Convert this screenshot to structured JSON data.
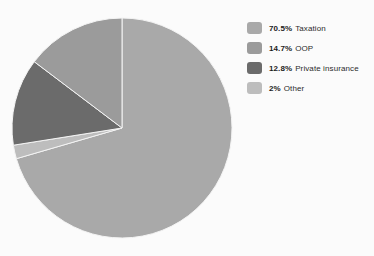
{
  "chart_data": {
    "type": "pie",
    "title": "",
    "subtitle": "",
    "xlabel": "",
    "ylabel": "",
    "grid": false,
    "legend_position": "right",
    "units": "percent",
    "total": 100,
    "start_angle_deg": 0,
    "direction": "clockwise",
    "categories": [
      "Taxation",
      "OOP",
      "Private insurance",
      "Other"
    ],
    "values": [
      70.5,
      14.7,
      12.8,
      2
    ],
    "value_labels": [
      "70.5%",
      "14.7%",
      "12.8%",
      "2%"
    ],
    "colors": [
      "#a9a9a9",
      "#9b9b9b",
      "#6b6b6b",
      "#bdbdbd"
    ],
    "slices": [
      {
        "label": "Taxation",
        "value": 70.5,
        "value_label": "70.5%",
        "color": "#a9a9a9"
      },
      {
        "label": "OOP",
        "value": 14.7,
        "value_label": "14.7%",
        "color": "#9b9b9b"
      },
      {
        "label": "Private insurance",
        "value": 12.8,
        "value_label": "12.8%",
        "color": "#6b6b6b"
      },
      {
        "label": "Other",
        "value": 2,
        "value_label": "2%",
        "color": "#bdbdbd"
      }
    ]
  },
  "legend": {
    "items": [
      {
        "percent": "70.5%",
        "label": "Taxation",
        "color": "#a9a9a9"
      },
      {
        "percent": "14.7%",
        "label": "OOP",
        "color": "#9b9b9b"
      },
      {
        "percent": "12.8%",
        "label": "Private insurance",
        "color": "#6b6b6b"
      },
      {
        "percent": "2%",
        "label": "Other",
        "color": "#bdbdbd"
      }
    ]
  },
  "style": {
    "background": "#fbfbfb",
    "slice_divider": "#f4f4f4",
    "pie_center_x": 122,
    "pie_center_y": 128,
    "pie_radius": 110
  }
}
